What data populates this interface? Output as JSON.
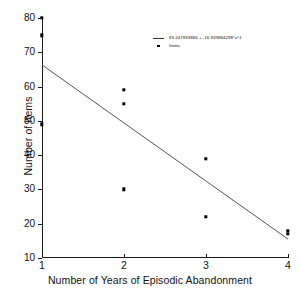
{
  "chart_data": {
    "type": "scatter",
    "title": "",
    "xlabel": "Number of Years of Episodic Abandonment",
    "ylabel": "Number of Items",
    "xlim": [
      1,
      4
    ],
    "ylim": [
      10,
      80
    ],
    "xticks": [
      "1",
      "2",
      "3",
      "4"
    ],
    "yticks": [
      "10",
      "20",
      "30",
      "40",
      "50",
      "60",
      "70",
      "80"
    ],
    "grid": false,
    "legend_position": "top-right",
    "series": [
      {
        "name": "83.247933884 + -16.933884298*x^1",
        "type": "line",
        "kind": "regression-fit",
        "intercept": 83.247933884,
        "slope": -16.933884298,
        "x": [
          1,
          4
        ],
        "values": [
          66.31,
          15.51
        ]
      },
      {
        "name": "Items",
        "type": "scatter",
        "points": [
          {
            "x": 1,
            "y": 80
          },
          {
            "x": 1,
            "y": 75
          },
          {
            "x": 1,
            "y": 49
          },
          {
            "x": 2,
            "y": 59
          },
          {
            "x": 2,
            "y": 55
          },
          {
            "x": 2,
            "y": 30
          },
          {
            "x": 3,
            "y": 39
          },
          {
            "x": 3,
            "y": 22
          },
          {
            "x": 4,
            "y": 18
          },
          {
            "x": 4,
            "y": 17
          }
        ]
      }
    ]
  },
  "legend": {
    "fit_label": "83.247933884 + -16.933884298*x^1",
    "items_label": "Items"
  },
  "colors": {
    "axis": "#1a1a1a",
    "marker": "#000000",
    "fit_line": "#555555",
    "background": "#ffffff"
  }
}
